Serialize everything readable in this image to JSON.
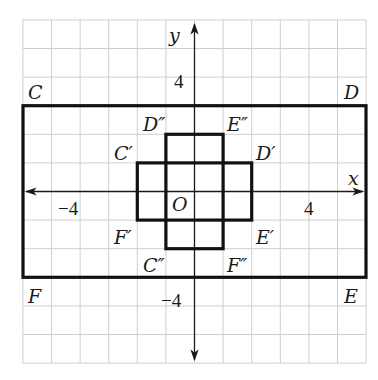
{
  "figure": {
    "grid": {
      "min": -6,
      "max": 6,
      "step": 1,
      "color": "#cfcfcf"
    },
    "axes": {
      "x_label": "x",
      "y_label": "y",
      "origin_label": "O",
      "tick_labels": {
        "x_neg": "−4",
        "x_pos": "4",
        "y_pos": "4",
        "y_neg": "−4"
      }
    },
    "rectangles": [
      {
        "name": "CDEF",
        "vertices": [
          {
            "label": "C",
            "x": -6,
            "y": 3
          },
          {
            "label": "D",
            "x": 6,
            "y": 3
          },
          {
            "label": "E",
            "x": 6,
            "y": -3
          },
          {
            "label": "F",
            "x": -6,
            "y": -3
          }
        ]
      },
      {
        "name": "C'D'E'F'",
        "vertices": [
          {
            "label": "C′",
            "x": -2,
            "y": 1
          },
          {
            "label": "D′",
            "x": 2,
            "y": 1
          },
          {
            "label": "E′",
            "x": 2,
            "y": -1
          },
          {
            "label": "F′",
            "x": -2,
            "y": -1
          }
        ]
      },
      {
        "name": "C''D''E''F''",
        "vertices": [
          {
            "label": "D″",
            "x": -1,
            "y": 2
          },
          {
            "label": "E″",
            "x": 1,
            "y": 2
          },
          {
            "label": "F″",
            "x": 1,
            "y": -2
          },
          {
            "label": "C″",
            "x": -1,
            "y": -2
          }
        ]
      }
    ]
  }
}
